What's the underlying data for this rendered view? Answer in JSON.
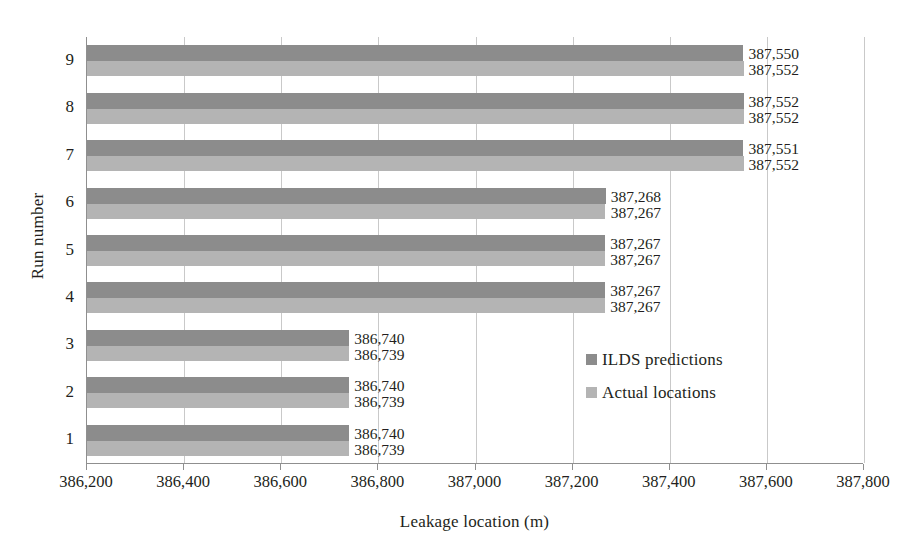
{
  "chart_data": {
    "type": "bar",
    "orientation": "horizontal",
    "title": "",
    "xlabel": "Leakage location (m)",
    "ylabel": "Run number",
    "categories": [
      "1",
      "2",
      "3",
      "4",
      "5",
      "6",
      "7",
      "8",
      "9"
    ],
    "xlim": [
      386200,
      387800
    ],
    "xticks": [
      386200,
      386400,
      386600,
      386800,
      387000,
      387200,
      387400,
      387600,
      387800
    ],
    "xticklabels": [
      "386,200",
      "386,400",
      "386,600",
      "386,800",
      "387,000",
      "387,200",
      "387,400",
      "387,600",
      "387,800"
    ],
    "grid": true,
    "grid_axis": "x",
    "legend_position": "inside-right",
    "series": [
      {
        "name": "ILDS predictions",
        "color": "#8c8c8c",
        "values": [
          386740,
          386740,
          386740,
          387267,
          387267,
          387268,
          387551,
          387552,
          387550
        ],
        "labels": [
          "386,740",
          "386,740",
          "386,740",
          "387,267",
          "387,267",
          "387,268",
          "387,551",
          "387,552",
          "387,550"
        ]
      },
      {
        "name": "Actual locations",
        "color": "#b4b4b4",
        "values": [
          386739,
          386739,
          386739,
          387267,
          387267,
          387267,
          387552,
          387552,
          387552
        ],
        "labels": [
          "386,739",
          "386,739",
          "386,739",
          "387,267",
          "387,267",
          "387,267",
          "387,552",
          "387,552",
          "387,552"
        ]
      }
    ]
  },
  "axes": {
    "x_title": "Leakage location (m)",
    "y_title": "Run number"
  },
  "legend": {
    "items": [
      {
        "label": "ILDS predictions",
        "color": "#8c8c8c"
      },
      {
        "label": "Actual locations",
        "color": "#b4b4b4"
      }
    ]
  }
}
